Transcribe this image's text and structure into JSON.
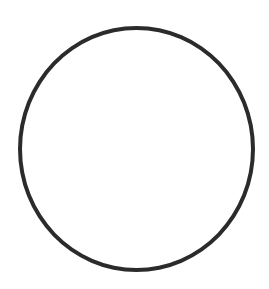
{
  "figure": {
    "shape": "circle-outline",
    "stroke_color": "#2b2b2b",
    "fill_color": "#ffffff",
    "background_color": "#ffffff"
  }
}
